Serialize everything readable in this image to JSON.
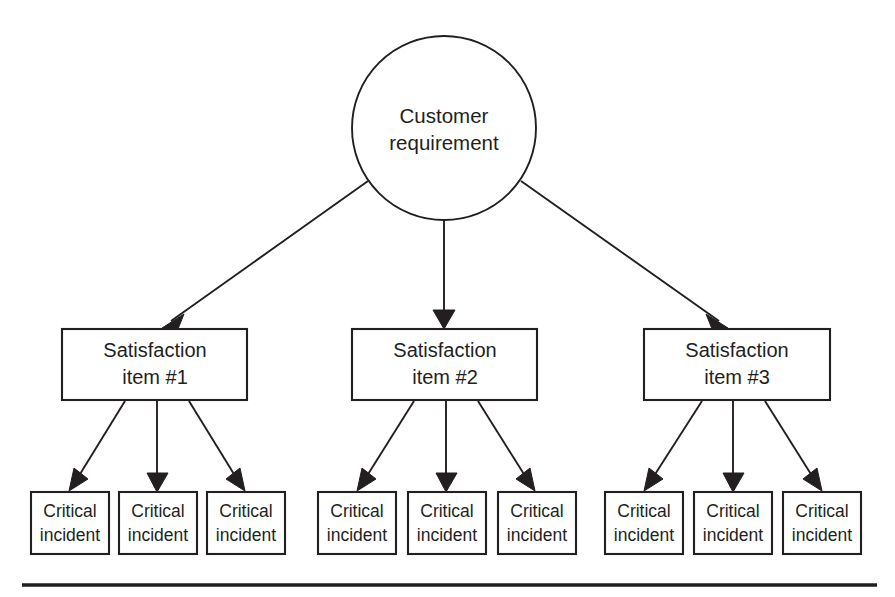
{
  "diagram": {
    "type": "hierarchy-tree",
    "title_text": "",
    "colors": {
      "stroke": "#231f20",
      "fill": "#ffffff",
      "background": "#ffffff",
      "arrowhead": "#231f20"
    },
    "root": {
      "id": "customer-requirement",
      "shape": "circle",
      "line1": "Customer",
      "line2": "requirement",
      "cx": 444,
      "cy": 128,
      "r": 92
    },
    "level2": [
      {
        "id": "satisfaction-item-1",
        "shape": "rectangle",
        "line1": "Satisfaction",
        "line2": "item #1",
        "x": 62,
        "y": 329,
        "w": 185,
        "h": 71
      },
      {
        "id": "satisfaction-item-2",
        "shape": "rectangle",
        "line1": "Satisfaction",
        "line2": "item #2",
        "x": 352,
        "y": 329,
        "w": 185,
        "h": 71
      },
      {
        "id": "satisfaction-item-3",
        "shape": "rectangle",
        "line1": "Satisfaction",
        "line2": "item #3",
        "x": 644,
        "y": 329,
        "w": 186,
        "h": 71
      }
    ],
    "level3": [
      {
        "id": "critical-incident-1-1",
        "shape": "rectangle",
        "line1": "Critical",
        "line2": "incident",
        "x": 31,
        "y": 492,
        "w": 78,
        "h": 62
      },
      {
        "id": "critical-incident-1-2",
        "shape": "rectangle",
        "line1": "Critical",
        "line2": "incident",
        "x": 119,
        "y": 492,
        "w": 78,
        "h": 62
      },
      {
        "id": "critical-incident-1-3",
        "shape": "rectangle",
        "line1": "Critical",
        "line2": "incident",
        "x": 207,
        "y": 492,
        "w": 78,
        "h": 62
      },
      {
        "id": "critical-incident-2-1",
        "shape": "rectangle",
        "line1": "Critical",
        "line2": "incident",
        "x": 318,
        "y": 492,
        "w": 78,
        "h": 62
      },
      {
        "id": "critical-incident-2-2",
        "shape": "rectangle",
        "line1": "Critical",
        "line2": "incident",
        "x": 408,
        "y": 492,
        "w": 78,
        "h": 62
      },
      {
        "id": "critical-incident-2-3",
        "shape": "rectangle",
        "line1": "Critical",
        "line2": "incident",
        "x": 498,
        "y": 492,
        "w": 78,
        "h": 62
      },
      {
        "id": "critical-incident-3-1",
        "shape": "rectangle",
        "line1": "Critical",
        "line2": "incident",
        "x": 605,
        "y": 492,
        "w": 78,
        "h": 62
      },
      {
        "id": "critical-incident-3-2",
        "shape": "rectangle",
        "line1": "Critical",
        "line2": "incident",
        "x": 694,
        "y": 492,
        "w": 78,
        "h": 62
      },
      {
        "id": "critical-incident-3-3",
        "shape": "rectangle",
        "line1": "Critical",
        "line2": "incident",
        "x": 783,
        "y": 492,
        "w": 78,
        "h": 62
      }
    ],
    "edges": [
      {
        "id": "edge-root-to-item-1",
        "from": "customer-requirement",
        "to": "satisfaction-item-1"
      },
      {
        "id": "edge-root-to-item-2",
        "from": "customer-requirement",
        "to": "satisfaction-item-2"
      },
      {
        "id": "edge-root-to-item-3",
        "from": "customer-requirement",
        "to": "satisfaction-item-3"
      },
      {
        "id": "edge-item-1-to-incident-1-1",
        "from": "satisfaction-item-1",
        "to": "critical-incident-1-1"
      },
      {
        "id": "edge-item-1-to-incident-1-2",
        "from": "satisfaction-item-1",
        "to": "critical-incident-1-2"
      },
      {
        "id": "edge-item-1-to-incident-1-3",
        "from": "satisfaction-item-1",
        "to": "critical-incident-1-3"
      },
      {
        "id": "edge-item-2-to-incident-2-1",
        "from": "satisfaction-item-2",
        "to": "critical-incident-2-1"
      },
      {
        "id": "edge-item-2-to-incident-2-2",
        "from": "satisfaction-item-2",
        "to": "critical-incident-2-2"
      },
      {
        "id": "edge-item-2-to-incident-2-3",
        "from": "satisfaction-item-2",
        "to": "critical-incident-2-3"
      },
      {
        "id": "edge-item-3-to-incident-3-1",
        "from": "satisfaction-item-3",
        "to": "critical-incident-3-1"
      },
      {
        "id": "edge-item-3-to-incident-3-2",
        "from": "satisfaction-item-3",
        "to": "critical-incident-3-2"
      },
      {
        "id": "edge-item-3-to-incident-3-3",
        "from": "satisfaction-item-3",
        "to": "critical-incident-3-3"
      }
    ],
    "footer_rule": {
      "x1": 22,
      "x2": 877,
      "y": 585
    }
  }
}
